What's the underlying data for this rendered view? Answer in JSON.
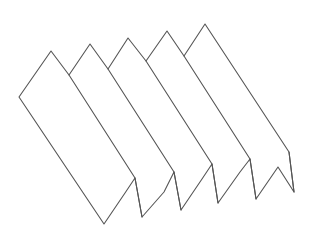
{
  "diagram": {
    "panel_count": 5,
    "stroke_color": "#555555",
    "background_color": "#ffffff",
    "outline": [
      [
        19,
        97
      ],
      [
        51,
        51
      ],
      [
        69,
        75
      ],
      [
        90,
        44
      ],
      [
        108,
        69
      ],
      [
        128,
        38
      ],
      [
        146,
        61
      ],
      [
        167,
        31
      ],
      [
        184,
        56
      ],
      [
        205,
        24
      ],
      [
        289,
        152
      ],
      [
        294,
        192
      ],
      [
        278,
        167
      ],
      [
        256,
        199
      ],
      [
        250,
        159
      ],
      [
        240,
        172
      ],
      [
        218,
        203
      ],
      [
        212,
        164
      ],
      [
        202,
        179
      ],
      [
        181,
        210
      ],
      [
        174,
        172
      ],
      [
        164,
        192
      ],
      [
        142,
        217
      ],
      [
        135,
        178
      ],
      [
        125,
        193
      ],
      [
        104,
        224
      ]
    ],
    "inner_edges": [
      [
        [
          69,
          75
        ],
        [
          135,
          178
        ]
      ],
      [
        [
          108,
          69
        ],
        [
          174,
          172
        ]
      ],
      [
        [
          146,
          61
        ],
        [
          212,
          164
        ]
      ],
      [
        [
          184,
          56
        ],
        [
          250,
          159
        ]
      ],
      [
        [
          135,
          178
        ],
        [
          142,
          217
        ]
      ],
      [
        [
          174,
          172
        ],
        [
          181,
          210
        ]
      ],
      [
        [
          212,
          164
        ],
        [
          218,
          203
        ]
      ],
      [
        [
          250,
          159
        ],
        [
          256,
          199
        ]
      ],
      [
        [
          289,
          152
        ],
        [
          294,
          192
        ]
      ]
    ]
  }
}
